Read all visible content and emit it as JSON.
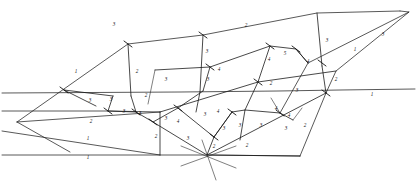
{
  "figure": {
    "kind": "line-network-diagram",
    "background_color": "#ffffff",
    "stroke_color": "#1b1b1b",
    "label_color": "#111111",
    "width": 417,
    "height": 181
  },
  "chart_data": {
    "type": "diagram",
    "title": "",
    "xlabel": "",
    "ylabel": "",
    "grid": false,
    "legend": false,
    "label_values": [
      1,
      2,
      3,
      4,
      5
    ],
    "nodes": [
      {
        "id": "n1",
        "x": 17,
        "y": 122
      },
      {
        "id": "n2",
        "x": 64,
        "y": 90
      },
      {
        "id": "n3",
        "x": 128,
        "y": 44
      },
      {
        "id": "n4",
        "x": 203,
        "y": 35
      },
      {
        "id": "n5",
        "x": 317,
        "y": 13
      },
      {
        "id": "n6",
        "x": 400,
        "y": 11
      },
      {
        "id": "n7",
        "x": 409,
        "y": 12
      },
      {
        "id": "n8",
        "x": 336,
        "y": 71
      },
      {
        "id": "n9",
        "x": 270,
        "y": 46
      },
      {
        "id": "n10",
        "x": 296,
        "y": 49
      },
      {
        "id": "n11",
        "x": 308,
        "y": 63
      },
      {
        "id": "n12",
        "x": 258,
        "y": 82
      },
      {
        "id": "n13",
        "x": 210,
        "y": 67
      },
      {
        "id": "n14",
        "x": 203,
        "y": 91
      },
      {
        "id": "n15",
        "x": 155,
        "y": 70
      },
      {
        "id": "n16",
        "x": 113,
        "y": 96
      },
      {
        "id": "n17",
        "x": 108,
        "y": 111
      },
      {
        "id": "n18",
        "x": 136,
        "y": 112
      },
      {
        "id": "n19",
        "x": 153,
        "y": 122
      },
      {
        "id": "n20",
        "x": 178,
        "y": 108
      },
      {
        "id": "n21",
        "x": 214,
        "y": 137
      },
      {
        "id": "n22",
        "x": 232,
        "y": 112
      },
      {
        "id": "n23",
        "x": 245,
        "y": 110
      },
      {
        "id": "n24",
        "x": 280,
        "y": 113
      },
      {
        "id": "n25",
        "x": 207,
        "y": 155
      },
      {
        "id": "n26",
        "x": 326,
        "y": 93
      },
      {
        "id": "n27",
        "x": 293,
        "y": 120
      }
    ],
    "labels": [
      {
        "text": "2",
        "x": 246,
        "y": 26
      },
      {
        "text": "3",
        "x": 114,
        "y": 25
      },
      {
        "text": "3",
        "x": 327,
        "y": 41
      },
      {
        "text": "3",
        "x": 383,
        "y": 35
      },
      {
        "text": "1",
        "x": 355,
        "y": 50
      },
      {
        "text": "3",
        "x": 207,
        "y": 52
      },
      {
        "text": "4",
        "x": 219,
        "y": 70
      },
      {
        "text": "5",
        "x": 285,
        "y": 54
      },
      {
        "text": "4",
        "x": 269,
        "y": 60
      },
      {
        "text": "4",
        "x": 308,
        "y": 62
      },
      {
        "text": "3",
        "x": 208,
        "y": 80
      },
      {
        "text": "2",
        "x": 271,
        "y": 84
      },
      {
        "text": "3",
        "x": 297,
        "y": 91
      },
      {
        "text": "2",
        "x": 336,
        "y": 80
      },
      {
        "text": "1",
        "x": 76,
        "y": 72
      },
      {
        "text": "2",
        "x": 137,
        "y": 72
      },
      {
        "text": "3",
        "x": 166,
        "y": 80
      },
      {
        "text": "2",
        "x": 146,
        "y": 96
      },
      {
        "text": "3",
        "x": 90,
        "y": 101
      },
      {
        "text": "3",
        "x": 111,
        "y": 100
      },
      {
        "text": "3",
        "x": 124,
        "y": 112
      },
      {
        "text": "3",
        "x": 140,
        "y": 114
      },
      {
        "text": "2",
        "x": 91,
        "y": 122
      },
      {
        "text": "2",
        "x": 156,
        "y": 137
      },
      {
        "text": "3",
        "x": 166,
        "y": 119
      },
      {
        "text": "4",
        "x": 178,
        "y": 122
      },
      {
        "text": "3",
        "x": 188,
        "y": 139
      },
      {
        "text": "3",
        "x": 205,
        "y": 115
      },
      {
        "text": "4",
        "x": 218,
        "y": 112
      },
      {
        "text": "3",
        "x": 224,
        "y": 129
      },
      {
        "text": "3",
        "x": 240,
        "y": 126
      },
      {
        "text": "4",
        "x": 276,
        "y": 109
      },
      {
        "text": "4",
        "x": 289,
        "y": 116
      },
      {
        "text": "3",
        "x": 261,
        "y": 126
      },
      {
        "text": "3",
        "x": 286,
        "y": 129
      },
      {
        "text": "2",
        "x": 214,
        "y": 147
      },
      {
        "text": "2",
        "x": 247,
        "y": 146
      },
      {
        "text": "2",
        "x": 305,
        "y": 126
      },
      {
        "text": "1",
        "x": 372,
        "y": 95
      },
      {
        "text": "1",
        "x": 88,
        "y": 139
      },
      {
        "text": "1",
        "x": 88,
        "y": 158
      }
    ],
    "edges": [
      {
        "id": "e-top-long",
        "points": "128,44 203,35 317,13 400,11"
      },
      {
        "id": "e-upper-left",
        "points": "17,122 128,44"
      },
      {
        "id": "e-left-low",
        "points": "17,122 64,150"
      },
      {
        "id": "e-hline-upper",
        "points": "2,93 180,92 278,92 340,90 415,89"
      },
      {
        "id": "e-hline-mid",
        "points": "2,111 108,111 160,112"
      },
      {
        "id": "e-hline-bottom",
        "points": "2,155 207,155 300,156"
      },
      {
        "id": "e-right-apex",
        "points": "400,11 409,12 336,71 326,93"
      },
      {
        "id": "e-right-inner",
        "points": "409,12 308,63 280,113"
      },
      {
        "id": "e-vert-a",
        "points": "128,44 131,96"
      },
      {
        "id": "e-vert-b",
        "points": "203,35 200,92"
      },
      {
        "id": "e-vert-c",
        "points": "317,13 322,66"
      },
      {
        "id": "e-diag-main",
        "points": "160,112 258,82 336,71"
      },
      {
        "id": "e-diag-lower",
        "points": "153,122 207,155 300,156 326,93"
      },
      {
        "id": "e-mid-chain",
        "points": "155,70 210,67 270,46 296,49 308,63"
      },
      {
        "id": "e-poly-5a",
        "points": "270,46 258,82"
      },
      {
        "id": "e-poly-5b",
        "points": "296,49 308,63"
      },
      {
        "id": "e-low-chain",
        "points": "108,111 136,112 153,122 178,108 214,137"
      },
      {
        "id": "e-cluster-a",
        "points": "113,96 108,111"
      },
      {
        "id": "e-cluster-b",
        "points": "136,112 131,96"
      },
      {
        "id": "e-cluster-c",
        "points": "64,90 113,96"
      },
      {
        "id": "e-cell-a",
        "points": "178,108 203,91"
      },
      {
        "id": "e-cell-b",
        "points": "214,137 232,112"
      },
      {
        "id": "e-cell-c",
        "points": "232,112 245,110 280,113"
      },
      {
        "id": "e-cell-d",
        "points": "245,110 232,137"
      },
      {
        "id": "e-cell-e",
        "points": "280,113 293,120"
      },
      {
        "id": "e-cell-f",
        "points": "258,82 245,110"
      },
      {
        "id": "e-drop-a",
        "points": "160,112 160,155"
      },
      {
        "id": "e-drop-b",
        "points": "214,137 207,155"
      },
      {
        "id": "e-star-a",
        "points": "186,146 232,166"
      },
      {
        "id": "e-star-b",
        "points": "232,146 186,166"
      },
      {
        "id": "e-star-c",
        "points": "207,140 212,178"
      }
    ]
  }
}
